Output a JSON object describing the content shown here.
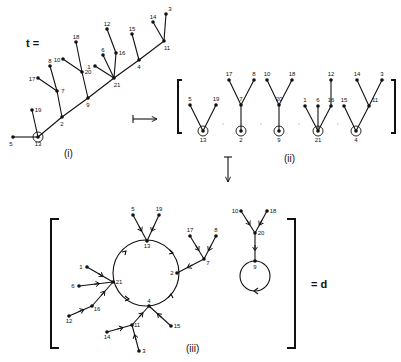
{
  "figure": {
    "tree_label": "t =",
    "result_label": "= d",
    "panel_labels": {
      "i": "(i)",
      "ii": "(ii)",
      "iii": "(iii)"
    },
    "separator": ","
  },
  "panel_i": {
    "nodes": [
      {
        "id": "13",
        "x": 38,
        "y": 137,
        "root": true
      },
      {
        "id": "5",
        "x": 13,
        "y": 137
      },
      {
        "id": "19",
        "x": 32,
        "y": 110
      },
      {
        "id": "2",
        "x": 62,
        "y": 117
      },
      {
        "id": "7",
        "x": 57,
        "y": 91
      },
      {
        "id": "17",
        "x": 38,
        "y": 78
      },
      {
        "id": "8",
        "x": 50,
        "y": 66
      },
      {
        "id": "9",
        "x": 88,
        "y": 98
      },
      {
        "id": "20",
        "x": 82,
        "y": 72
      },
      {
        "id": "10",
        "x": 63,
        "y": 59
      },
      {
        "id": "18",
        "x": 76,
        "y": 42
      },
      {
        "id": "21",
        "x": 114,
        "y": 78
      },
      {
        "id": "1",
        "x": 95,
        "y": 66
      },
      {
        "id": "6",
        "x": 103,
        "y": 55
      },
      {
        "id": "16",
        "x": 116,
        "y": 53
      },
      {
        "id": "12",
        "x": 107,
        "y": 29
      },
      {
        "id": "4",
        "x": 139,
        "y": 60
      },
      {
        "id": "15",
        "x": 132,
        "y": 34
      },
      {
        "id": "11",
        "x": 164,
        "y": 41
      },
      {
        "id": "14",
        "x": 153,
        "y": 22
      },
      {
        "id": "3",
        "x": 166,
        "y": 14
      }
    ],
    "edges": [
      [
        "5",
        "13"
      ],
      [
        "19",
        "13"
      ],
      [
        "13",
        "2"
      ],
      [
        "2",
        "9"
      ],
      [
        "9",
        "21"
      ],
      [
        "21",
        "4"
      ],
      [
        "4",
        "11"
      ],
      [
        "7",
        "2"
      ],
      [
        "17",
        "7"
      ],
      [
        "8",
        "7"
      ],
      [
        "20",
        "9"
      ],
      [
        "10",
        "20"
      ],
      [
        "18",
        "20"
      ],
      [
        "1",
        "21"
      ],
      [
        "6",
        "21"
      ],
      [
        "16",
        "21"
      ],
      [
        "12",
        "16"
      ],
      [
        "15",
        "4"
      ],
      [
        "14",
        "11"
      ],
      [
        "3",
        "11"
      ]
    ]
  },
  "panel_ii": {
    "subtrees": [
      {
        "root": "13",
        "nodes": [
          {
            "id": "13",
            "x": 203,
            "y": 131
          },
          {
            "id": "5",
            "x": 190,
            "y": 105
          },
          {
            "id": "19",
            "x": 216,
            "y": 105
          }
        ],
        "edges": [
          [
            "5",
            "13"
          ],
          [
            "19",
            "13"
          ]
        ]
      },
      {
        "root": "2",
        "nodes": [
          {
            "id": "2",
            "x": 241,
            "y": 131
          },
          {
            "id": "7",
            "x": 241,
            "y": 105
          },
          {
            "id": "17",
            "x": 229,
            "y": 80
          },
          {
            "id": "8",
            "x": 254,
            "y": 80
          }
        ],
        "edges": [
          [
            "7",
            "2"
          ],
          [
            "17",
            "7"
          ],
          [
            "8",
            "7"
          ]
        ]
      },
      {
        "root": "9",
        "nodes": [
          {
            "id": "9",
            "x": 279,
            "y": 131
          },
          {
            "id": "20",
            "x": 279,
            "y": 105
          },
          {
            "id": "10",
            "x": 267,
            "y": 80
          },
          {
            "id": "18",
            "x": 292,
            "y": 80
          }
        ],
        "edges": [
          [
            "20",
            "9"
          ],
          [
            "10",
            "20"
          ],
          [
            "18",
            "20"
          ]
        ]
      },
      {
        "root": "21",
        "nodes": [
          {
            "id": "21",
            "x": 318,
            "y": 131
          },
          {
            "id": "1",
            "x": 305,
            "y": 106
          },
          {
            "id": "6",
            "x": 318,
            "y": 106
          },
          {
            "id": "16",
            "x": 331,
            "y": 106
          },
          {
            "id": "12",
            "x": 331,
            "y": 80
          }
        ],
        "edges": [
          [
            "1",
            "21"
          ],
          [
            "6",
            "21"
          ],
          [
            "16",
            "21"
          ],
          [
            "12",
            "16"
          ]
        ]
      },
      {
        "root": "4",
        "nodes": [
          {
            "id": "4",
            "x": 356,
            "y": 131
          },
          {
            "id": "15",
            "x": 344,
            "y": 106
          },
          {
            "id": "11",
            "x": 369,
            "y": 106
          },
          {
            "id": "14",
            "x": 357,
            "y": 80
          },
          {
            "id": "3",
            "x": 382,
            "y": 80
          }
        ],
        "edges": [
          [
            "15",
            "4"
          ],
          [
            "11",
            "4"
          ],
          [
            "14",
            "11"
          ],
          [
            "3",
            "11"
          ]
        ]
      }
    ]
  },
  "panel_iii": {
    "cycle_main": {
      "cx": 146,
      "cy": 273,
      "r": 33,
      "members": [
        "13",
        "2",
        "4",
        "21"
      ]
    },
    "cycle_loop": {
      "cx": 255,
      "cy": 276,
      "r": 15,
      "members": [
        "9"
      ]
    },
    "nodes": [
      {
        "id": "13",
        "x": 147,
        "y": 241
      },
      {
        "id": "5",
        "x": 133,
        "y": 215
      },
      {
        "id": "19",
        "x": 159,
        "y": 215
      },
      {
        "id": "2",
        "x": 177,
        "y": 273
      },
      {
        "id": "7",
        "x": 204,
        "y": 259
      },
      {
        "id": "17",
        "x": 190,
        "y": 236
      },
      {
        "id": "8",
        "x": 216,
        "y": 236
      },
      {
        "id": "4",
        "x": 149,
        "y": 306
      },
      {
        "id": "15",
        "x": 171,
        "y": 326
      },
      {
        "id": "11",
        "x": 132,
        "y": 325
      },
      {
        "id": "14",
        "x": 107,
        "y": 332
      },
      {
        "id": "3",
        "x": 139,
        "y": 351
      },
      {
        "id": "21",
        "x": 113,
        "y": 282
      },
      {
        "id": "1",
        "x": 87,
        "y": 267
      },
      {
        "id": "6",
        "x": 79,
        "y": 286
      },
      {
        "id": "16",
        "x": 92,
        "y": 306
      },
      {
        "id": "12",
        "x": 69,
        "y": 316
      },
      {
        "id": "9",
        "x": 255,
        "y": 261
      },
      {
        "id": "20",
        "x": 255,
        "y": 233
      },
      {
        "id": "10",
        "x": 241,
        "y": 211
      },
      {
        "id": "18",
        "x": 267,
        "y": 211
      }
    ],
    "edges": [
      [
        "5",
        "13"
      ],
      [
        "19",
        "13"
      ],
      [
        "7",
        "2"
      ],
      [
        "17",
        "7"
      ],
      [
        "8",
        "7"
      ],
      [
        "15",
        "4"
      ],
      [
        "11",
        "4"
      ],
      [
        "14",
        "11"
      ],
      [
        "3",
        "11"
      ],
      [
        "1",
        "21"
      ],
      [
        "6",
        "21"
      ],
      [
        "16",
        "21"
      ],
      [
        "12",
        "16"
      ],
      [
        "20",
        "9"
      ],
      [
        "10",
        "20"
      ],
      [
        "18",
        "20"
      ]
    ]
  },
  "arrows": {
    "maps_to": {
      "x1": 133,
      "y1": 119,
      "x2": 157,
      "y2": 119
    },
    "down": {
      "x1": 228,
      "y1": 157,
      "x2": 228,
      "y2": 181
    }
  },
  "colors": {
    "ink": "#111111",
    "paper": "#ffffff"
  }
}
